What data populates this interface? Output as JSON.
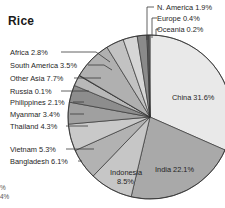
{
  "chart": {
    "title": "Rice",
    "edge_fragment_1": "%",
    "edge_fragment_2": "4%"
  },
  "chart_data": {
    "type": "pie",
    "title": "Rice",
    "subtitle": "",
    "xlabel": "",
    "ylabel": "",
    "unit": "%",
    "legend_position": "callout-labels",
    "grid": false,
    "start_angle_deg": 0,
    "direction": "clockwise",
    "total": 100.0,
    "labels": [
      "China",
      "India",
      "Indonesia",
      "Bangladesh",
      "Vietnam",
      "Thailand",
      "Myanmar",
      "Philippines",
      "Russia",
      "Other Asia",
      "South America",
      "Africa",
      "N. America",
      "Europe",
      "Oceania"
    ],
    "values": [
      31.6,
      22.1,
      8.5,
      6.1,
      5.3,
      4.3,
      3.4,
      2.1,
      0.1,
      7.7,
      3.5,
      2.8,
      1.9,
      0.4,
      0.2
    ],
    "slice_labels": [
      "China 31.6%",
      "India 22.1%",
      "Indonesia 8.5%",
      "Bangladesh 6.1%",
      "Vietnam 5.3%",
      "Thailand 4.3%",
      "Myanmar 3.4%",
      "Philippines 2.1%",
      "Russia 0.1%",
      "Other Asia 7.7%",
      "South America 3.5%",
      "Africa 2.8%",
      "N. America 1.9%",
      "Europe 0.4%",
      "Oceania 0.2%"
    ],
    "colors": [
      "#e9e9e9",
      "#a9a9a9",
      "#c6c6c6",
      "#b2b2b2",
      "#c9c9c9",
      "#a0a0a0",
      "#8d8d8d",
      "#b8b8b8",
      "#6f6f6f",
      "#b0b0b0",
      "#c2c2c2",
      "#d6d6d6",
      "#8a8a8a",
      "#6a6a6a",
      "#9a9a9a"
    ]
  },
  "labels": {
    "inside": [
      {
        "text": "China 31.6%",
        "x": 172,
        "y": 100
      },
      {
        "text": "India 22.1%",
        "x": 155,
        "y": 172
      },
      {
        "text": "Indonesia",
        "x": 110,
        "y": 175
      },
      {
        "text": "8.5%",
        "x": 117,
        "y": 184
      }
    ],
    "left": [
      {
        "text": "Africa 2.8%",
        "x": 10,
        "y": 55,
        "line_x1": 61,
        "line_x2": 96,
        "line_y": 52,
        "tip_x": 110,
        "tip_y": 62
      },
      {
        "text": "South America 3.5%",
        "x": 10,
        "y": 68,
        "line_x1": 88,
        "line_x2": 104,
        "line_y": 65,
        "tip_x": 112,
        "tip_y": 70
      },
      {
        "text": "Other Asia 7.7%",
        "x": 10,
        "y": 81,
        "line_x1": 74,
        "line_x2": 101,
        "line_y": 78,
        "tip_x": 101,
        "tip_y": 78
      },
      {
        "text": "Russia 0.1%",
        "x": 10,
        "y": 94,
        "line_x1": 61,
        "line_x2": 89,
        "line_y": 91,
        "tip_x": 89,
        "tip_y": 91
      },
      {
        "text": "Philippines 2.1%",
        "x": 10,
        "y": 105,
        "line_x1": 73,
        "line_x2": 84,
        "line_y": 102,
        "tip_x": 84,
        "tip_y": 102
      },
      {
        "text": "Myanmar 3.4%",
        "x": 10,
        "y": 117,
        "line_x1": 70,
        "line_x2": 84,
        "line_y": 114,
        "tip_x": 84,
        "tip_y": 114
      },
      {
        "text": "Thailand 4.3%",
        "x": 10,
        "y": 129,
        "line_x1": 66,
        "line_x2": 88,
        "line_y": 126,
        "tip_x": 88,
        "tip_y": 126
      },
      {
        "text": "Vietnam 5.3%",
        "x": 10,
        "y": 152,
        "line_x1": 66,
        "line_x2": 94,
        "line_y": 149,
        "tip_x": 94,
        "tip_y": 149
      },
      {
        "text": "Bangladesh 6.1%",
        "x": 10,
        "y": 164,
        "line_x1": 78,
        "line_x2": 82,
        "line_y": 161,
        "tip_x": 82,
        "tip_y": 161
      }
    ],
    "top_right": [
      {
        "text": "N. America 1.9%",
        "x": 157,
        "y": 10,
        "line_x": 147,
        "line_y1": 7,
        "line_y2": 40,
        "tick_x2": 154
      },
      {
        "text": "Europe 0.4%",
        "x": 157,
        "y": 21,
        "line_x": 152,
        "line_y1": 18,
        "line_y2": 38,
        "tick_x2": 157
      },
      {
        "text": "Oceania 0.2%",
        "x": 157,
        "y": 32,
        "line_x": 156,
        "line_y1": 29,
        "line_y2": 36,
        "tick_x2": 160
      }
    ]
  },
  "geometry": {
    "center_x": 150,
    "center_y": 117,
    "radius": 82
  }
}
